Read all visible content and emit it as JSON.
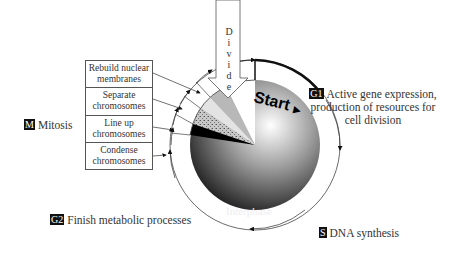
{
  "diagram": {
    "divide_label": "Divide",
    "divide_letters": [
      "D",
      "i",
      "v",
      "i",
      "d",
      "e"
    ],
    "start_label": "Start",
    "center_label": "Interphase",
    "phases": {
      "g1": {
        "tag": "G1",
        "text_lines": [
          "Active gene expression,",
          "production of resources for",
          "cell division"
        ]
      },
      "s": {
        "tag": "S",
        "text": "DNA synthesis"
      },
      "g2": {
        "tag": "G2",
        "text": "Finish metabolic processes"
      },
      "m": {
        "tag": "M",
        "text": "Mitosis"
      }
    },
    "mitosis_steps": [
      {
        "line1": "Rebuild nuclear",
        "line2": "membranes"
      },
      {
        "line1": "Separate",
        "line2": "chromosomes"
      },
      {
        "line1": "Line up",
        "line2": "chromosomes"
      },
      {
        "line1": "Condense",
        "line2": "chromosomes"
      }
    ]
  }
}
